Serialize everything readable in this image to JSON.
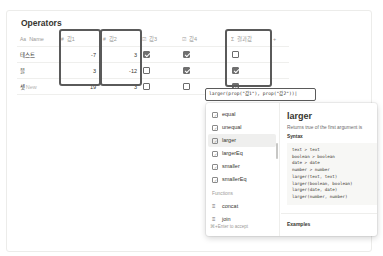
{
  "database": {
    "title": "Operators",
    "columns": [
      {
        "label": "Name",
        "icon": "Aa"
      },
      {
        "label": "값1",
        "icon": "#"
      },
      {
        "label": "값2",
        "icon": "#"
      },
      {
        "label": "값3",
        "icon": "☑"
      },
      {
        "label": "값4",
        "icon": "☑"
      },
      {
        "label": "결과값",
        "icon": "Σ"
      }
    ],
    "add_column_label": "+",
    "rows": [
      {
        "name": "테스트",
        "v1": "-7",
        "v2": "3",
        "c3": true,
        "c4": true,
        "result": false
      },
      {
        "name": "블",
        "v1": "3",
        "v2": "-12",
        "c3": false,
        "c4": true,
        "result": true
      },
      {
        "name": "셋",
        "v1": "19",
        "v2": "3",
        "c3": false,
        "c4": false,
        "result": true
      }
    ],
    "new_row_label": "+ New"
  },
  "formula": {
    "value": "larger(prop(\"값1\"), prop(\"값2\"))|"
  },
  "autocomplete": {
    "operators": [
      {
        "label": "equal"
      },
      {
        "label": "unequal"
      },
      {
        "label": "larger",
        "selected": true
      },
      {
        "label": "largerEq"
      },
      {
        "label": "smaller"
      },
      {
        "label": "smallerEq"
      }
    ],
    "functions_section_label": "Functions",
    "functions": [
      {
        "label": "concat"
      },
      {
        "label": "join"
      }
    ],
    "footer_hint": "⌘+Enter to accept",
    "detail": {
      "title": "larger",
      "description": "Returns true of the first argument is",
      "syntax_label": "Syntax",
      "syntax_code": "text > text\nboolean > boolean\ndate > date\nnumber > number\nlarger(text, text)\nlarger(boolean, boolean)\nlarger(date, date)\nlarger(number, number)",
      "examples_label": "Examples"
    }
  },
  "colors": {
    "highlight_border": "#5a5a5a",
    "checkbox_checked": "#6f6f6f",
    "text_primary": "#37352f",
    "text_muted": "#9b9a97"
  }
}
